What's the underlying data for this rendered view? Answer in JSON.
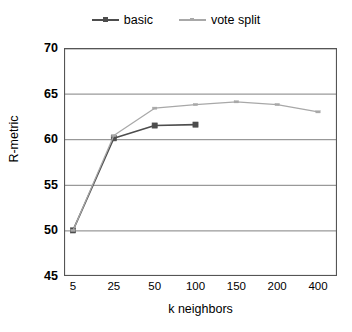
{
  "chart_data": {
    "type": "line",
    "title": "",
    "xlabel": "k neighbors",
    "ylabel": "R-metric",
    "categories": [
      "5",
      "25",
      "50",
      "100",
      "150",
      "200",
      "400"
    ],
    "x": [
      5,
      25,
      50,
      100,
      150,
      200,
      400
    ],
    "ylim": [
      45,
      70
    ],
    "yticks": [
      70,
      65,
      60,
      55,
      50,
      45
    ],
    "xticks": [
      "5",
      "25",
      "50",
      "100",
      "150",
      "200",
      "400"
    ],
    "grid": "horizontal",
    "legend_position": "top-center",
    "series": [
      {
        "name": "basic",
        "color": "#4d4d4d",
        "marker": "square",
        "values": [
          50.0,
          60.1,
          61.5,
          61.6,
          null,
          null,
          null
        ]
      },
      {
        "name": "vote split",
        "color": "#a8a8a8",
        "marker": "dash",
        "values": [
          50.0,
          60.4,
          63.4,
          63.8,
          64.1,
          63.8,
          63.0
        ]
      }
    ]
  },
  "legend": {
    "entries": [
      {
        "label": "basic"
      },
      {
        "label": "vote split"
      }
    ]
  },
  "axes": {
    "y_title": "R-metric",
    "x_title": "k neighbors",
    "y_tick_labels": [
      "70",
      "65",
      "60",
      "55",
      "50",
      "45"
    ],
    "x_tick_labels": [
      "5",
      "25",
      "50",
      "100",
      "150",
      "200",
      "400"
    ]
  },
  "colors": {
    "basic": "#4d4d4d",
    "vote_split": "#a8a8a8",
    "grid": "#808080",
    "axis": "#555555",
    "background": "#ffffff"
  }
}
